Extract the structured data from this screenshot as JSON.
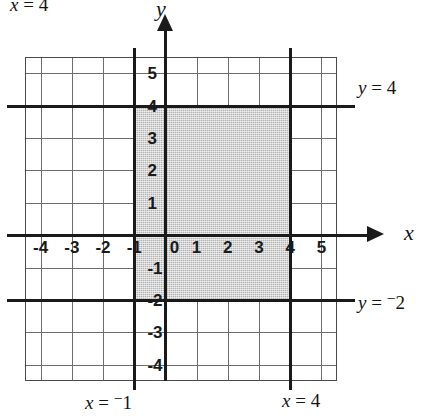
{
  "figure": {
    "title_top_left": "x = 4",
    "axis_x_name": "x",
    "axis_y_name": "y"
  },
  "labels": {
    "y_equals_4": "y = 4",
    "y_equals_neg2_prefix": "y = ",
    "y_equals_neg2_sign": "−",
    "y_equals_neg2_value": "2",
    "x_equals_neg1_prefix": "x = ",
    "x_equals_neg1_sign": "−",
    "x_equals_neg1_value": "1",
    "x_equals_4_prefix": "x = ",
    "x_equals_4_value": "4",
    "top_left_prefix": "x = ",
    "top_left_value": "4"
  },
  "chart_data": {
    "type": "scatter",
    "title": "",
    "xlabel": "x",
    "ylabel": "y",
    "xlim": [
      -4.5,
      5.5
    ],
    "ylim": [
      -4.5,
      5.5
    ],
    "grid": true,
    "grid_step": 1,
    "legend": "none",
    "x_ticks": [
      -4,
      -3,
      -2,
      -1,
      0,
      1,
      2,
      3,
      4,
      5
    ],
    "x_tick_labels": [
      "-4",
      "-3",
      "-2",
      "-1",
      "0",
      "1",
      "2",
      "3",
      "4",
      "5"
    ],
    "y_ticks": [
      -4,
      -3,
      -2,
      -1,
      1,
      2,
      3,
      4,
      5
    ],
    "y_tick_labels": [
      "-4",
      "-3",
      "-2",
      "-1",
      "1",
      "2",
      "3",
      "4",
      "5"
    ],
    "boundary_lines": [
      {
        "name": "x = -1",
        "type": "vertical",
        "value": -1
      },
      {
        "name": "x = 4",
        "type": "vertical",
        "value": 4
      },
      {
        "name": "y = 4",
        "type": "horizontal",
        "value": 4
      },
      {
        "name": "y = -2",
        "type": "horizontal",
        "value": -2
      }
    ],
    "shaded_region": {
      "x_min": -1,
      "x_max": 4,
      "y_min": -2,
      "y_max": 4,
      "fill": "#b4b4b4"
    }
  },
  "colors": {
    "ink": "#1a1a1a",
    "grid": "#6d6d6d",
    "shade": "#b4b4b4",
    "background": "#ffffff"
  }
}
